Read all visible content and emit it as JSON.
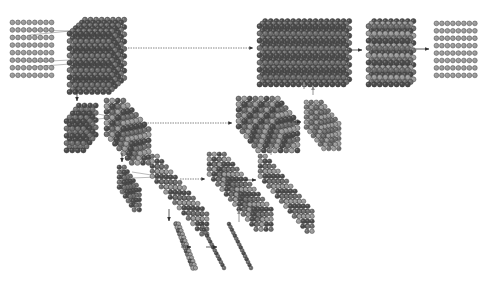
{
  "diagram": {
    "type": "u-net-architecture-sphere-volumes",
    "colors": {
      "background": "#ffffff",
      "sphere_light": "#9a9a9a",
      "sphere_mid": "#6e6e6e",
      "sphere_dark": "#4a4a4a",
      "sphere_outline": "#3a3a3a",
      "arrow": "#333333",
      "skip_arrow": "#555555",
      "up_arrow": "#888888"
    },
    "blocks": [
      {
        "id": "input-grid",
        "kind": "flat",
        "x": 10,
        "y": 20,
        "cols": 8,
        "rows": 8,
        "pitch": 5.6,
        "r": 2.4,
        "shade": "light"
      },
      {
        "id": "enc1-conv",
        "kind": "volume",
        "x": 67,
        "y": 16,
        "cols": 8,
        "rows": 9,
        "depth": 6,
        "pitch": 5.6,
        "dx": 0.55,
        "dy": -0.5,
        "r": 2.6,
        "shade": "dark"
      },
      {
        "id": "enc2-pool",
        "kind": "volume",
        "x": 64,
        "y": 106,
        "cols": 4,
        "rows": 5,
        "depth": 5,
        "pitch": 5.6,
        "dx": 0.55,
        "dy": -0.7,
        "r": 2.6,
        "shade": "dark"
      },
      {
        "id": "enc2-conv",
        "kind": "skew",
        "x": 104,
        "y": 98,
        "cols": 4,
        "rows": 7,
        "depth": 7,
        "pitch": 5.6,
        "dx": 0.75,
        "dy": 0.85,
        "r": 2.6,
        "shade": "mid"
      },
      {
        "id": "enc3-pool",
        "kind": "skew",
        "x": 117,
        "y": 165,
        "cols": 2,
        "rows": 5,
        "depth": 6,
        "pitch": 5.0,
        "dx": 0.6,
        "dy": 0.9,
        "r": 2.3,
        "shade": "dark"
      },
      {
        "id": "enc3-conv",
        "kind": "skew",
        "x": 150,
        "y": 154,
        "cols": 2,
        "rows": 5,
        "depth": 12,
        "pitch": 5.0,
        "dx": 0.9,
        "dy": 1.05,
        "r": 2.3,
        "shade": "mid"
      },
      {
        "id": "bottleneck-pool",
        "kind": "line",
        "x1": 176,
        "y1": 224,
        "x2": 193,
        "y2": 268,
        "n": 14,
        "r": 2.4,
        "shade": "mid"
      },
      {
        "id": "bottleneck-conv-a",
        "kind": "line",
        "x1": 201,
        "y1": 224,
        "x2": 224,
        "y2": 268,
        "n": 16,
        "r": 1.9,
        "shade": "dark"
      },
      {
        "id": "bottleneck-conv-b",
        "kind": "line",
        "x1": 229,
        "y1": 224,
        "x2": 251,
        "y2": 268,
        "n": 16,
        "r": 1.9,
        "shade": "dark"
      },
      {
        "id": "dec3-concat",
        "kind": "skew",
        "x": 207,
        "y": 152,
        "cols": 4,
        "rows": 5,
        "depth": 12,
        "pitch": 5.0,
        "dx": 0.85,
        "dy": 1.0,
        "r": 2.3,
        "shade": "mid"
      },
      {
        "id": "dec3-conv",
        "kind": "skew",
        "x": 258,
        "y": 154,
        "cols": 2,
        "rows": 5,
        "depth": 12,
        "pitch": 5.0,
        "dx": 0.85,
        "dy": 1.0,
        "r": 2.3,
        "shade": "mid"
      },
      {
        "id": "dec2-concat",
        "kind": "skew",
        "x": 236,
        "y": 96,
        "cols": 8,
        "rows": 6,
        "depth": 6,
        "pitch": 5.6,
        "dx": 0.7,
        "dy": 0.85,
        "r": 2.6,
        "shade": "mid"
      },
      {
        "id": "dec2-conv",
        "kind": "skew",
        "x": 304,
        "y": 100,
        "cols": 4,
        "rows": 6,
        "depth": 6,
        "pitch": 5.0,
        "dx": 0.7,
        "dy": 0.85,
        "r": 2.3,
        "shade": "light"
      },
      {
        "id": "dec1-concat",
        "kind": "volume",
        "x": 257,
        "y": 16,
        "cols": 16,
        "rows": 9,
        "depth": 3,
        "pitch": 5.6,
        "dx": 0.5,
        "dy": -0.45,
        "r": 2.6,
        "shade": "dark"
      },
      {
        "id": "dec1-conv",
        "kind": "volume",
        "x": 366,
        "y": 16,
        "cols": 8,
        "rows": 9,
        "depth": 3,
        "pitch": 5.6,
        "dx": 0.5,
        "dy": -0.45,
        "r": 2.6,
        "shade": "mid"
      },
      {
        "id": "output-grid",
        "kind": "flat",
        "x": 434,
        "y": 21,
        "cols": 8,
        "rows": 8,
        "pitch": 5.5,
        "r": 2.4,
        "shade": "light"
      }
    ],
    "arrows": [
      {
        "id": "skip-level1",
        "style": "dashed",
        "x1": 118,
        "y1": 48,
        "x2": 253,
        "y2": 48
      },
      {
        "id": "skip-level2",
        "style": "dashed",
        "x1": 140,
        "y1": 123,
        "x2": 232,
        "y2": 123
      },
      {
        "id": "skip-level3",
        "style": "dashed",
        "x1": 180,
        "y1": 179,
        "x2": 205,
        "y2": 179
      },
      {
        "id": "dec1-to-conv",
        "style": "solid",
        "x1": 351,
        "y1": 50,
        "x2": 362,
        "y2": 50
      },
      {
        "id": "conv-to-out",
        "style": "solid",
        "x1": 416,
        "y1": 49,
        "x2": 429,
        "y2": 49
      },
      {
        "id": "dec2-to-conv",
        "style": "solid",
        "x1": 290,
        "y1": 122,
        "x2": 301,
        "y2": 122
      },
      {
        "id": "dec3-to-conv",
        "style": "solid",
        "x1": 245,
        "y1": 180,
        "x2": 256,
        "y2": 180
      },
      {
        "id": "bn-a-to-b",
        "style": "solid",
        "x1": 206,
        "y1": 247,
        "x2": 217,
        "y2": 247
      },
      {
        "id": "bn-pool-to-a",
        "style": "solid",
        "x1": 181,
        "y1": 247,
        "x2": 191,
        "y2": 247
      },
      {
        "id": "down-1",
        "style": "solid",
        "x1": 77,
        "y1": 86,
        "x2": 77,
        "y2": 101
      },
      {
        "id": "down-2",
        "style": "solid",
        "x1": 122,
        "y1": 153,
        "x2": 122,
        "y2": 162
      },
      {
        "id": "down-3",
        "style": "solid",
        "x1": 169,
        "y1": 209,
        "x2": 169,
        "y2": 221
      },
      {
        "id": "up-3",
        "style": "up",
        "x1": 239,
        "y1": 222,
        "x2": 239,
        "y2": 210
      },
      {
        "id": "up-2a",
        "style": "up",
        "x1": 271,
        "y1": 155,
        "x2": 271,
        "y2": 146
      },
      {
        "id": "up-2b",
        "style": "up",
        "x1": 313,
        "y1": 95,
        "x2": 313,
        "y2": 86
      },
      {
        "id": "up-1",
        "style": "up",
        "x1": 304,
        "y1": 89,
        "x2": 304,
        "y2": 82
      }
    ],
    "fan_lines": [
      {
        "x1": 30,
        "y1": 30,
        "x2": 70,
        "y2": 31
      },
      {
        "x1": 30,
        "y1": 35,
        "x2": 70,
        "y2": 31
      },
      {
        "x1": 30,
        "y1": 62,
        "x2": 70,
        "y2": 60
      },
      {
        "x1": 30,
        "y1": 67,
        "x2": 70,
        "y2": 64
      },
      {
        "x1": 88,
        "y1": 112,
        "x2": 108,
        "y2": 116
      },
      {
        "x1": 88,
        "y1": 120,
        "x2": 108,
        "y2": 118
      },
      {
        "x1": 132,
        "y1": 172,
        "x2": 158,
        "y2": 176
      },
      {
        "x1": 132,
        "y1": 178,
        "x2": 158,
        "y2": 177
      }
    ]
  }
}
